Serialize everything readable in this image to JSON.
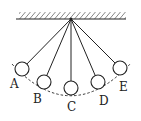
{
  "diagram": {
    "type": "pendulum-positions",
    "colors": {
      "stroke": "#222222",
      "background": "#ffffff"
    },
    "ceiling": {
      "x1": 16,
      "x2": 126,
      "y": 19,
      "hatch": true
    },
    "pivot": {
      "x": 71,
      "y": 19
    },
    "bob_radius": 7,
    "positions": [
      {
        "label": "A",
        "cx": 22,
        "cy": 69,
        "lx": 10,
        "ly": 88
      },
      {
        "label": "B",
        "cx": 44,
        "cy": 82,
        "lx": 33,
        "ly": 103
      },
      {
        "label": "C",
        "cx": 71,
        "cy": 88,
        "lx": 67,
        "ly": 111
      },
      {
        "label": "D",
        "cx": 98,
        "cy": 82,
        "lx": 99,
        "ly": 105
      },
      {
        "label": "E",
        "cx": 120,
        "cy": 68,
        "lx": 119,
        "ly": 91
      }
    ],
    "arc": {
      "path": "M 12 64 Q 71 128 131 63",
      "dashed": true
    }
  }
}
